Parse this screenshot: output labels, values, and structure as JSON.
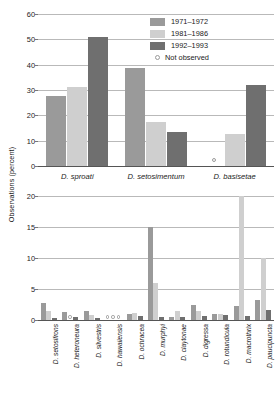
{
  "axis": {
    "ylabel": "Observations (percent)"
  },
  "legend": {
    "position": "top-right",
    "items": [
      {
        "label": "1971–1972",
        "color": "#9a9a9a",
        "marker": "swatch"
      },
      {
        "label": "1981–1986",
        "color": "#cfcfcf",
        "marker": "swatch"
      },
      {
        "label": "1992–1993",
        "color": "#6f6f6f",
        "marker": "swatch"
      },
      {
        "label": "Not observed",
        "color": "#9a9a9a",
        "marker": "circle"
      }
    ]
  },
  "chart_data": [
    {
      "type": "bar",
      "id": "top-panel",
      "title": "",
      "xlabel": "",
      "ylabel": "Observations (percent)",
      "ylim": [
        0,
        60
      ],
      "yticks": [
        0,
        10,
        20,
        30,
        40,
        50,
        60
      ],
      "grid": true,
      "legend_position": "top-right",
      "categories": [
        "D. sproati",
        "D. setosimentum",
        "D. basisetae"
      ],
      "series": [
        {
          "name": "1971–1972",
          "color": "#9a9a9a",
          "values": [
            27.5,
            38.5,
            null
          ]
        },
        {
          "name": "1981–1986",
          "color": "#cfcfcf",
          "values": [
            31.0,
            17.5,
            12.5
          ]
        },
        {
          "name": "1992–1993",
          "color": "#6f6f6f",
          "values": [
            51.0,
            13.5,
            32.0
          ]
        }
      ],
      "not_observed": [
        {
          "category": "D. basisetae",
          "series": "1971–1972"
        }
      ]
    },
    {
      "type": "bar",
      "id": "bottom-panel",
      "title": "",
      "xlabel": "",
      "ylabel": "Observations (percent)",
      "ylim": [
        0,
        20
      ],
      "yticks": [
        0,
        5,
        10,
        15,
        20
      ],
      "grid": true,
      "categories": [
        "D. setosifrons",
        "D. heteroneura",
        "D. silvestris",
        "D. hawaiiensis",
        "D. ochracea",
        "D. murphyi",
        "D. claytonae",
        "D. digressa",
        "D. rotundicula",
        "D. macrothrix",
        "D. paucipuncta"
      ],
      "series": [
        {
          "name": "1971–1972",
          "color": "#9a9a9a",
          "values": [
            2.8,
            1.3,
            1.4,
            null,
            1.0,
            15.0,
            0.5,
            2.5,
            0.9,
            2.2,
            3.2
          ]
        },
        {
          "name": "1981–1986",
          "color": "#cfcfcf",
          "values": [
            1.5,
            null,
            0.8,
            null,
            1.2,
            6.0,
            1.4,
            1.5,
            1.0,
            20.0,
            10.0
          ]
        },
        {
          "name": "1992–1993",
          "color": "#6f6f6f",
          "values": [
            0.4,
            0.5,
            0.3,
            null,
            0.6,
            0.5,
            0.5,
            0.7,
            0.8,
            0.7,
            1.6
          ]
        }
      ],
      "not_observed": [
        {
          "category": "D. setosifrons",
          "series": "1992–1993"
        },
        {
          "category": "D. heteroneura",
          "series": "1981–1986"
        },
        {
          "category": "D. heteroneura",
          "series": "1992–1993"
        },
        {
          "category": "D. silvestris",
          "series": "1992–1993"
        },
        {
          "category": "D. hawaiiensis",
          "series": "1981–1986"
        },
        {
          "category": "D. hawaiiensis",
          "series": "1992–1993"
        }
      ]
    }
  ]
}
